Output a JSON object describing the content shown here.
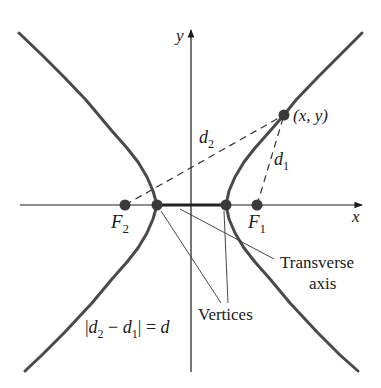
{
  "figure": {
    "type": "hyperbola-definition-diagram",
    "colors": {
      "curve": "#4a4a4a",
      "axis": "#1a1a1a",
      "dashed": "#333333",
      "point": "#3a3a3a",
      "text": "#1a1a1a"
    },
    "axes": {
      "x_label": "x",
      "y_label": "y"
    },
    "foci": [
      {
        "id": "F1",
        "label": "F",
        "subscript": "1"
      },
      {
        "id": "F2",
        "label": "F",
        "subscript": "2"
      }
    ],
    "point_on_curve": {
      "label": "(x, y)"
    },
    "distances": [
      {
        "id": "d1",
        "label": "d",
        "subscript": "1"
      },
      {
        "id": "d2",
        "label": "d",
        "subscript": "2"
      }
    ],
    "annotations": {
      "transverse_axis_line1": "Transverse",
      "transverse_axis_line2": "axis",
      "vertices": "Vertices"
    },
    "equation": {
      "bar_left": "|",
      "d2": "d",
      "d2_sub": "2",
      "minus": " − ",
      "d1": "d",
      "d1_sub": "1",
      "bar_right": "|",
      "equals": " = ",
      "rhs": "d"
    }
  }
}
